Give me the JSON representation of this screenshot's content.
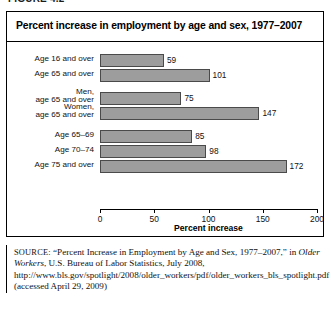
{
  "artifact": {
    "ghost_text": "FIGURE 4.2"
  },
  "figure": {
    "title": "Percent increase in employment by age and sex, 1977–2007",
    "axis_title": "Percent increase",
    "tick_labels": [
      "0",
      "50",
      "100",
      "150",
      "200"
    ],
    "bar_color": "#9d9d9d",
    "bar_border_color": "#4a4a4a"
  },
  "source": {
    "label": "SOURCE:",
    "part1": " “Percent Increase in Employment by Age and Sex, 1977–2007,” in ",
    "italic1": "Older Workers",
    "part2": ", U.S. Bureau of Labor Statistics, July 2008, http://www.bls.gov/spotlight/2008/older_workers/pdf/older_workers_bls_spotlight.pdf (accessed April 29, 2009)"
  },
  "chart_data": {
    "type": "bar",
    "title": "Percent increase in employment by age and sex, 1977–2007",
    "xlabel": "Percent increase",
    "ylabel": "",
    "xlim": [
      0,
      200
    ],
    "xticks": [
      0,
      50,
      100,
      150,
      200
    ],
    "orientation": "horizontal",
    "grid": false,
    "legend": false,
    "groups": [
      {
        "name": "all",
        "bars": [
          {
            "label_line1": "Age 16 and over",
            "label_line2": "",
            "value": 59
          },
          {
            "label_line1": "Age 65 and over",
            "label_line2": "",
            "value": 101
          }
        ]
      },
      {
        "name": "by-sex",
        "bars": [
          {
            "label_line1": "Men,",
            "label_line2": "age 65 and over",
            "value": 75
          },
          {
            "label_line1": "Women,",
            "label_line2": "age 65 and over",
            "value": 147
          }
        ]
      },
      {
        "name": "by-age-band",
        "bars": [
          {
            "label_line1": "Age 65–69",
            "label_line2": "",
            "value": 85
          },
          {
            "label_line1": "Age 70–74",
            "label_line2": "",
            "value": 98
          },
          {
            "label_line1": "Age 75 and over",
            "label_line2": "",
            "value": 172
          }
        ]
      }
    ],
    "categories": [
      "Age 16 and over",
      "Age 65 and over",
      "Men, age 65 and over",
      "Women, age 65 and over",
      "Age 65–69",
      "Age 70–74",
      "Age 75 and over"
    ],
    "values": [
      59,
      101,
      75,
      147,
      85,
      98,
      172
    ]
  }
}
